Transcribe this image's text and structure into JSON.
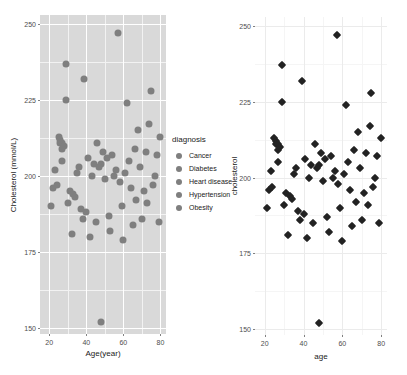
{
  "chart_data": [
    {
      "id": "left-plot",
      "type": "scatter",
      "title": "",
      "xlabel": "Age(year)",
      "ylabel": "Cholesterol (mmol/L)",
      "xlim": [
        15,
        83
      ],
      "ylim": [
        148,
        253
      ],
      "xticks": [
        20,
        40,
        60,
        80
      ],
      "yticks": [
        150,
        175,
        200,
        225,
        250
      ],
      "grid": true,
      "panel_background": "#d9d9d9",
      "gridline_color": "#ffffff",
      "marker": "circle",
      "marker_color": "#7f7f7f",
      "legend": {
        "position": "right",
        "title": "diagnosis",
        "entries": [
          "Cancer",
          "Diabetes",
          "Heart disease",
          "Hypertension",
          "Obesity"
        ]
      },
      "x": [
        57,
        29,
        39,
        75,
        29,
        62,
        74,
        25,
        26,
        26,
        27,
        28,
        27,
        46,
        49,
        54,
        68,
        80,
        27,
        41,
        48,
        51,
        66,
        36,
        44,
        47,
        63,
        72,
        78,
        23,
        35,
        43,
        50,
        55,
        56,
        61,
        69,
        77,
        22,
        24,
        31,
        33,
        34,
        58,
        64,
        71,
        76,
        21,
        30,
        37,
        40,
        59,
        67,
        73,
        38,
        45,
        52,
        65,
        70,
        79,
        32,
        42,
        53,
        60,
        48
      ],
      "y": [
        247,
        237,
        232,
        228,
        225,
        224,
        217,
        213,
        212,
        211,
        211,
        210,
        209,
        211,
        208,
        207,
        215,
        213,
        205,
        206,
        204,
        206,
        209,
        203,
        204,
        203,
        205,
        208,
        207,
        202,
        201,
        200,
        199,
        200,
        202,
        201,
        203,
        200,
        196,
        197,
        195,
        194,
        193,
        198,
        196,
        195,
        197,
        190,
        191,
        189,
        188,
        190,
        192,
        191,
        186,
        185,
        187,
        184,
        186,
        185,
        181,
        180,
        182,
        179,
        152
      ]
    },
    {
      "id": "right-plot",
      "type": "scatter",
      "title": "",
      "xlabel": "age",
      "ylabel": "cholesterol",
      "xlim": [
        15,
        83
      ],
      "ylim": [
        148,
        253
      ],
      "xticks": [
        20,
        40,
        60,
        80
      ],
      "yticks": [
        150,
        175,
        200,
        225,
        250
      ],
      "grid": true,
      "panel_background": "#ffffff",
      "gridline_color": "#ebebeb",
      "marker": "diamond",
      "marker_color": "#222222",
      "legend": null,
      "x": [
        57,
        29,
        39,
        75,
        29,
        62,
        74,
        25,
        26,
        26,
        27,
        28,
        27,
        46,
        49,
        54,
        68,
        80,
        27,
        41,
        48,
        51,
        66,
        36,
        44,
        47,
        63,
        72,
        78,
        23,
        35,
        43,
        50,
        55,
        56,
        61,
        69,
        77,
        22,
        24,
        31,
        33,
        34,
        58,
        64,
        71,
        76,
        21,
        30,
        37,
        40,
        59,
        67,
        73,
        38,
        45,
        52,
        65,
        70,
        79,
        32,
        42,
        53,
        60,
        48
      ],
      "y": [
        247,
        237,
        232,
        228,
        225,
        224,
        217,
        213,
        212,
        211,
        211,
        210,
        209,
        211,
        208,
        207,
        215,
        213,
        205,
        206,
        204,
        206,
        209,
        203,
        204,
        203,
        205,
        208,
        207,
        202,
        201,
        200,
        199,
        200,
        202,
        201,
        203,
        200,
        196,
        197,
        195,
        194,
        193,
        198,
        196,
        195,
        197,
        190,
        191,
        189,
        188,
        190,
        192,
        191,
        186,
        185,
        187,
        184,
        186,
        185,
        181,
        180,
        182,
        179,
        152
      ]
    }
  ],
  "left_plot": {
    "ylabel": "Cholesterol (mmol/L)",
    "xlabel": "Age(year)",
    "yticks": [
      "250",
      "225",
      "200",
      "175",
      "150"
    ],
    "xticks": [
      "20",
      "40",
      "60",
      "80"
    ]
  },
  "right_plot": {
    "ylabel": "cholesterol",
    "xlabel": "age",
    "yticks": [
      "250",
      "225",
      "200",
      "175",
      "150"
    ],
    "xticks": [
      "20",
      "40",
      "60",
      "80"
    ]
  },
  "legend": {
    "title": "diagnosis",
    "items": [
      {
        "label": "Cancer"
      },
      {
        "label": "Diabetes"
      },
      {
        "label": "Heart disease"
      },
      {
        "label": "Hypertension"
      },
      {
        "label": "Obesity"
      }
    ]
  }
}
